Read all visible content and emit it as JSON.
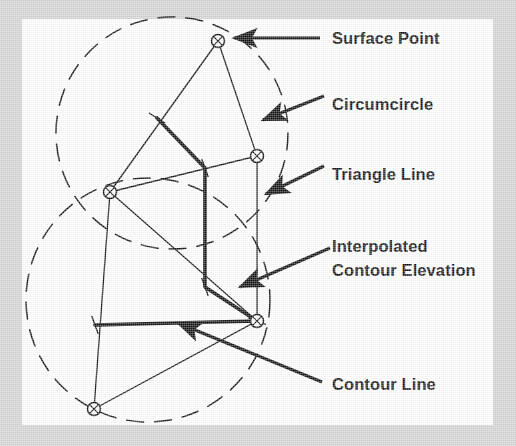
{
  "figure": {
    "kind": "tin-contour-interpolation-diagram",
    "background_color": "#d6d6d6",
    "plate_color": "#ffffff",
    "ink_color": "#131313",
    "plate": {
      "x": 22,
      "y": 19,
      "width": 471,
      "height": 406
    }
  },
  "labels": [
    {
      "id": "surface-point",
      "name": "surface-point-label",
      "lines": [
        "Surface Point"
      ],
      "x": 332,
      "y": 44,
      "leader": {
        "from": [
          320,
          38
        ],
        "to": [
          234,
          38
        ]
      }
    },
    {
      "id": "circumcircle",
      "name": "circumcircle-label",
      "lines": [
        "Circumcircle"
      ],
      "x": 332,
      "y": 110,
      "leader": {
        "from": [
          324,
          96
        ],
        "to": [
          263,
          120
        ]
      }
    },
    {
      "id": "triangle-line",
      "name": "triangle-line-label",
      "lines": [
        "Triangle Line"
      ],
      "x": 332,
      "y": 180,
      "leader": {
        "from": [
          324,
          166
        ],
        "to": [
          266,
          194
        ]
      }
    },
    {
      "id": "interpolated-contour-elevation",
      "name": "interpolated-contour-elevation-label",
      "lines": [
        "Interpolated",
        "Contour Elevation"
      ],
      "x": 332,
      "y": 252,
      "line_height": 24,
      "leader": {
        "from": [
          330,
          248
        ],
        "to": [
          240,
          287
        ]
      }
    },
    {
      "id": "contour-line",
      "name": "contour-line-label",
      "lines": [
        "Contour Line"
      ],
      "x": 332,
      "y": 390,
      "leader": {
        "from": [
          322,
          382
        ],
        "to": [
          178,
          323
        ]
      }
    }
  ],
  "geometry": {
    "vertices": [
      {
        "id": "v-top",
        "name": "surface-point-vertex-top",
        "x": 218,
        "y": 41
      },
      {
        "id": "v-left",
        "name": "surface-point-vertex-left",
        "x": 110,
        "y": 192
      },
      {
        "id": "v-right",
        "name": "surface-point-vertex-right",
        "x": 257,
        "y": 156
      },
      {
        "id": "v-lower-right",
        "name": "surface-point-vertex-lower-right",
        "x": 257,
        "y": 321
      },
      {
        "id": "v-bottom",
        "name": "surface-point-vertex-bottom",
        "x": 94,
        "y": 409
      }
    ],
    "triangle_lines": [
      {
        "from": "v-top",
        "to": "v-left"
      },
      {
        "from": "v-top",
        "to": "v-right"
      },
      {
        "from": "v-left",
        "to": "v-right"
      },
      {
        "from": "v-left",
        "to": "v-lower-right"
      },
      {
        "from": "v-right",
        "to": "v-lower-right"
      },
      {
        "from": "v-left",
        "to": "v-bottom"
      },
      {
        "from": "v-bottom",
        "to": "v-lower-right"
      }
    ],
    "circumcircles": [
      {
        "id": "cc-upper",
        "name": "circumcircle-upper",
        "cx": 172,
        "cy": 133,
        "r": 116
      },
      {
        "id": "cc-lower",
        "name": "circumcircle-lower",
        "cx": 148,
        "cy": 300,
        "r": 122
      }
    ],
    "contour_path": [
      [
        157,
        118
      ],
      [
        205,
        168
      ],
      [
        205,
        287
      ],
      [
        257,
        321
      ]
    ],
    "contour_line_segment": {
      "from": [
        95,
        325
      ],
      "to": [
        257,
        321
      ]
    },
    "elevation_ticks": [
      {
        "x": 157,
        "y": 118,
        "angle": 32
      },
      {
        "x": 205,
        "y": 168,
        "angle": 70
      },
      {
        "x": 205,
        "y": 287,
        "angle": 70
      },
      {
        "x": 257,
        "y": 321,
        "angle": 20
      },
      {
        "x": 95,
        "y": 325,
        "angle": 70
      }
    ]
  }
}
